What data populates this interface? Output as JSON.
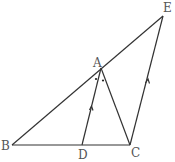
{
  "diagram": {
    "type": "geometry",
    "points": {
      "A": {
        "label": "A",
        "x": 101,
        "y": 68
      },
      "B": {
        "label": "B",
        "x": 12,
        "y": 145
      },
      "C": {
        "label": "C",
        "x": 130,
        "y": 145
      },
      "D": {
        "label": "D",
        "x": 82,
        "y": 145
      },
      "E": {
        "label": "E",
        "x": 163,
        "y": 16
      }
    },
    "segments": [
      "B-E",
      "B-C",
      "A-D",
      "A-C",
      "C-E"
    ],
    "marks": {
      "equal_angles": "angle BAD = angle DAC (dots)",
      "parallel": "AD ∥ EC (arrow marks)"
    },
    "line_color": "#333333",
    "label_color": "#555555"
  }
}
